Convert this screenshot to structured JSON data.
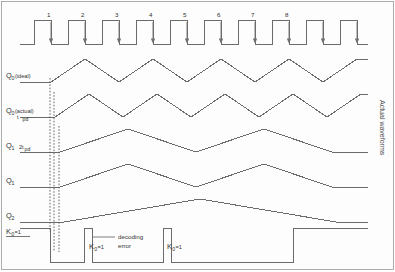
{
  "figure": {
    "type": "timing-diagram",
    "side_label": "Actual waveforms",
    "background_color": "#fdfdfd",
    "trace_color": "#6b6b6b",
    "dashed_color": "#555555"
  },
  "clock": {
    "name": "clock",
    "numbers": [
      "1",
      "2",
      "3",
      "4",
      "5",
      "6",
      "7",
      "8"
    ],
    "total_pulses": 10,
    "arrow_name": "falling-edge-arrow",
    "period_px": 34,
    "first_rise_x": 34
  },
  "signals": [
    {
      "key": "q0_ideal",
      "label": "Q",
      "subscript": "0",
      "paren": "(ideal)",
      "note": "",
      "note_sub": "",
      "divider": 2,
      "delay_px": 0,
      "baseline_y": 82,
      "high_y": 59
    },
    {
      "key": "q0_actual",
      "label": "Q",
      "subscript": "0",
      "paren": "(actual)",
      "note": "t",
      "note_sub": "pd",
      "divider": 2,
      "delay_px": 4,
      "baseline_y": 117,
      "high_y": 94
    },
    {
      "key": "q1_actual",
      "label": "Q",
      "subscript": "1",
      "paren": "",
      "note": "2t",
      "note_sub": "pd",
      "divider": 4,
      "delay_px": 9,
      "baseline_y": 152,
      "high_y": 129
    },
    {
      "key": "q1_div4",
      "label": "Q",
      "subscript": "1",
      "paren": "",
      "note": "",
      "note_sub": "",
      "divider": 4,
      "delay_px": 9,
      "baseline_y": 187,
      "high_y": 164
    },
    {
      "key": "q2_div8",
      "label": "Q",
      "subscript": "2",
      "paren": "",
      "note": "",
      "note_sub": "",
      "divider": 8,
      "delay_px": 13,
      "baseline_y": 222,
      "high_y": 199
    }
  ],
  "decode_row": {
    "key": "k0_decode",
    "label": "K",
    "subscript": "0",
    "equals": "=1",
    "baseline_high_y": 228,
    "low_y": 262
  },
  "annotations": [
    {
      "name": "k0-label-left",
      "text_label": "K",
      "sub": "0",
      "eq": "=1",
      "x": 6,
      "y": 234
    },
    {
      "name": "k0-label-mid",
      "text_label": "K",
      "sub": "0",
      "eq": "=1",
      "x": 89,
      "y": 249
    },
    {
      "name": "k0-label-right",
      "text_label": "K",
      "sub": "0",
      "eq": "=1",
      "x": 167,
      "y": 249
    }
  ],
  "decoding_error": {
    "name": "decoding-error-annotation",
    "line1": "decoding",
    "line2": "error",
    "x": 118,
    "y1": 239,
    "y2": 248
  },
  "dashed_markers": [
    {
      "name": "marker-ideal-edge",
      "x": 50,
      "y1": 78,
      "y2": 232
    },
    {
      "name": "marker-tpd-edge",
      "x": 54,
      "y1": 92,
      "y2": 252
    },
    {
      "name": "marker-2tpd-edge",
      "x": 59,
      "y1": 126,
      "y2": 252
    }
  ],
  "chart_data": {
    "type": "line",
    "xlabel": "time (clock cycles)",
    "ylabel": "logic level",
    "x": [
      0,
      1,
      2,
      3,
      4,
      5,
      6,
      7,
      8,
      9,
      10
    ],
    "series": [
      {
        "name": "clock",
        "values": [
          0,
          1,
          0,
          1,
          0,
          1,
          0,
          1,
          0,
          1,
          0
        ]
      },
      {
        "name": "Q0 (ideal)",
        "values": [
          0,
          1,
          0,
          1,
          0,
          1,
          0,
          1,
          0,
          1,
          0
        ]
      },
      {
        "name": "Q0 (actual)",
        "values": [
          0,
          1,
          0,
          1,
          0,
          1,
          0,
          1,
          0,
          1,
          0
        ]
      },
      {
        "name": "Q1",
        "values": [
          0,
          0,
          1,
          1,
          0,
          0,
          1,
          1,
          0,
          0,
          1
        ]
      },
      {
        "name": "Q1 (div4)",
        "values": [
          0,
          0,
          1,
          1,
          0,
          0,
          1,
          1,
          0,
          0,
          1
        ]
      },
      {
        "name": "Q2",
        "values": [
          0,
          0,
          0,
          0,
          1,
          1,
          1,
          1,
          0,
          0,
          0
        ]
      },
      {
        "name": "K0 decode",
        "values": [
          1,
          0,
          0,
          1,
          0,
          1,
          1,
          1,
          1,
          1,
          1
        ]
      }
    ],
    "legend": "none",
    "grid": false
  }
}
